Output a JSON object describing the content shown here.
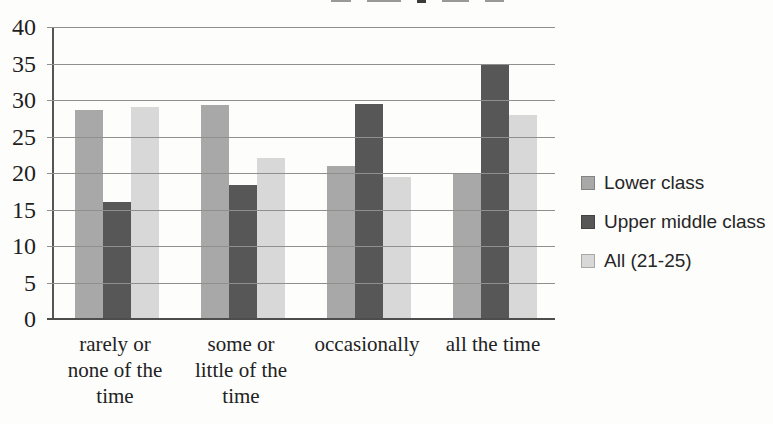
{
  "chart_data": {
    "type": "bar",
    "title": "",
    "categories": [
      "rarely or none of the time",
      "some or little of the time",
      "occasionally",
      "all the time"
    ],
    "category_lines": [
      [
        "rarely or",
        "none of the",
        "time"
      ],
      [
        "some or",
        "little of the",
        "time"
      ],
      [
        "occasionally"
      ],
      [
        "all the time"
      ]
    ],
    "series": [
      {
        "name": "Lower class",
        "color": "#a8a8a8",
        "values": [
          28.7,
          29.3,
          21.0,
          20.0
        ]
      },
      {
        "name": "Upper middle class",
        "color": "#575757",
        "values": [
          16.0,
          18.3,
          29.5,
          35.0
        ]
      },
      {
        "name": "All (21-25)",
        "color": "#d8d8d8",
        "values": [
          29.0,
          22.0,
          19.5,
          28.0
        ]
      }
    ],
    "xlabel": "",
    "ylabel": "",
    "ylim": [
      0,
      40
    ],
    "yticks": [
      0,
      5,
      10,
      15,
      20,
      25,
      30,
      35,
      40
    ],
    "grid": true,
    "legend_position": "right"
  },
  "colors": {
    "background": "#fdfdfc",
    "gridline": "#8f8f8f",
    "axis": "#4d4d4d",
    "text": "#2b2b2b"
  }
}
